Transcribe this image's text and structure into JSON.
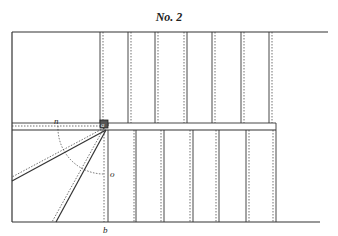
{
  "diagram": {
    "title": "No. 2",
    "labels": {
      "n": "n",
      "a": "a",
      "o": "o",
      "b": "b"
    },
    "colors": {
      "line": "#333333",
      "background": "#ffffff"
    }
  }
}
